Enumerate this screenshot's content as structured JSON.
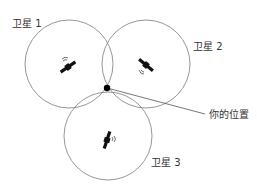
{
  "diagram": {
    "type": "gps-trilateration",
    "satellites": [
      {
        "label": "卫星 1",
        "icon": "satellite-icon"
      },
      {
        "label": "卫星 2",
        "icon": "satellite-icon"
      },
      {
        "label": "卫星 3",
        "icon": "satellite-icon"
      }
    ],
    "position_label": "你的位置",
    "colors": {
      "circle": "#8a8a8a",
      "satellite": "#111111",
      "dot": "#000000",
      "text": "#333333"
    }
  }
}
